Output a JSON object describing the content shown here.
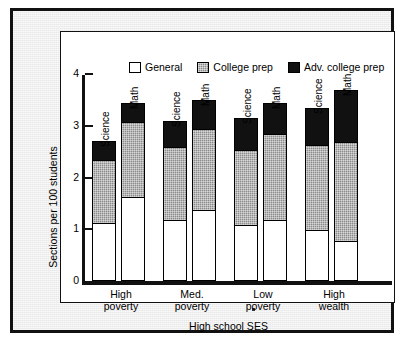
{
  "chart_data": {
    "type": "bar",
    "subtype": "stacked-grouped",
    "title": "",
    "xlabel": "High school SES",
    "ylabel": "Sections per 100 students",
    "ylim": [
      0,
      4
    ],
    "yticks": [
      "0",
      "1",
      "2",
      "3",
      "4"
    ],
    "grid": false,
    "legend_position": "top-inside",
    "categories": [
      "High poverty",
      "Med. poverty",
      "Low poverty",
      "High wealth"
    ],
    "subject_labels": [
      "Science",
      "Math"
    ],
    "series": [
      {
        "name": "General",
        "color": "#ffffff",
        "values": {
          "Science": [
            1.1,
            1.15,
            1.05,
            0.95
          ],
          "Math": [
            1.6,
            1.35,
            1.15,
            0.75
          ]
        }
      },
      {
        "name": "College prep",
        "color": "#8a8a8a",
        "values": {
          "Science": [
            1.25,
            1.45,
            1.5,
            1.7
          ],
          "Math": [
            1.5,
            1.6,
            1.7,
            1.95
          ]
        }
      },
      {
        "name": "Adv. college prep",
        "color": "#111111",
        "values": {
          "Science": [
            0.35,
            0.5,
            0.6,
            0.7
          ],
          "Math": [
            0.35,
            0.55,
            0.6,
            1.0
          ]
        }
      }
    ],
    "totals": {
      "Science": [
        2.7,
        3.1,
        3.15,
        3.35
      ],
      "Math": [
        3.45,
        3.5,
        3.45,
        3.7
      ]
    }
  },
  "legend": {
    "items": [
      {
        "label": "General",
        "swatch": "white-square-icon"
      },
      {
        "label": "College prep",
        "swatch": "gray-square-icon"
      },
      {
        "label": "Adv. college prep",
        "swatch": "black-square-icon"
      }
    ]
  },
  "axes": {
    "y_title": "Sections per 100 students",
    "x_title": "High school SES",
    "y_ticks": [
      "4",
      "3",
      "2",
      "1",
      "0"
    ]
  },
  "categories": [
    {
      "line1": "High",
      "line2": "poverty"
    },
    {
      "line1": "Med.",
      "line2": "poverty"
    },
    {
      "line1": "Low",
      "line2": "poverty"
    },
    {
      "line1": "High",
      "line2": "wealth"
    }
  ],
  "bars": [
    {
      "group": 0,
      "subject": "Science",
      "general": 1.1,
      "college": 1.25,
      "adv": 0.35
    },
    {
      "group": 0,
      "subject": "Math",
      "general": 1.6,
      "college": 1.5,
      "adv": 0.35
    },
    {
      "group": 1,
      "subject": "Science",
      "general": 1.15,
      "college": 1.45,
      "adv": 0.5
    },
    {
      "group": 1,
      "subject": "Math",
      "general": 1.35,
      "college": 1.6,
      "adv": 0.55
    },
    {
      "group": 2,
      "subject": "Science",
      "general": 1.05,
      "college": 1.5,
      "adv": 0.6
    },
    {
      "group": 2,
      "subject": "Math",
      "general": 1.15,
      "college": 1.7,
      "adv": 0.6
    },
    {
      "group": 3,
      "subject": "Science",
      "general": 0.95,
      "college": 1.7,
      "adv": 0.7
    },
    {
      "group": 3,
      "subject": "Math",
      "general": 0.75,
      "college": 1.95,
      "adv": 1.0
    }
  ],
  "colors": {
    "general": "#ffffff",
    "college_prep": "#8a8a8a",
    "adv_college_prep": "#111111",
    "frame": "#111111",
    "page": "#e8e8e8"
  }
}
